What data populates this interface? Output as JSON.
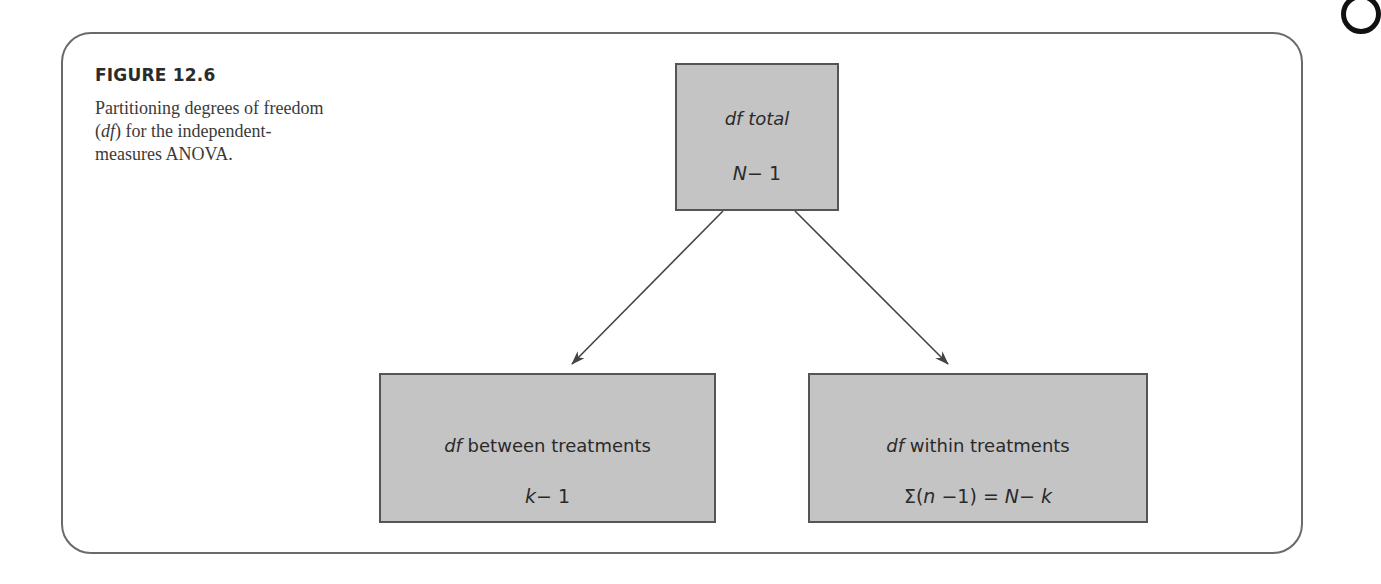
{
  "figure": {
    "label": "FIGURE 12.6",
    "caption": {
      "part1": "Partitioning degrees of freedom (",
      "italic": "df",
      "part2": ") for the independent-measures ANOVA."
    }
  },
  "diagram": {
    "root": {
      "title_italic": "df",
      "title_rest": " total",
      "formula_var": "N",
      "formula_rest": "− 1"
    },
    "children": [
      {
        "title_italic": "df",
        "title_rest": " between treatments",
        "formula_var": "k",
        "formula_rest": "− 1"
      },
      {
        "title_italic": "df",
        "title_rest": " within treatments",
        "formula_pre": "Σ(",
        "formula_var1": "n",
        "formula_mid": " −1) = ",
        "formula_var2": "N",
        "formula_mid2": "− ",
        "formula_var3": "k"
      }
    ],
    "colors": {
      "box_fill": "#c4c4c4",
      "box_border": "#555555",
      "arrow": "#444444",
      "frame": "#6a6a6a"
    }
  }
}
